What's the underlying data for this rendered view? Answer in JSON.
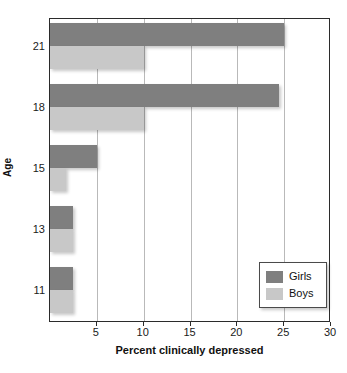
{
  "chart_data": {
    "type": "bar",
    "orientation": "horizontal",
    "title": "",
    "xlabel": "Percent clinically depressed",
    "ylabel": "Age",
    "categories": [
      "21",
      "18",
      "15",
      "13",
      "11"
    ],
    "series": [
      {
        "name": "Girls",
        "color": "#7f7f7f",
        "values": [
          25,
          24.5,
          5,
          2.5,
          2.5
        ]
      },
      {
        "name": "Boys",
        "color": "#c8c8c8",
        "values": [
          10,
          10,
          1.7,
          2.5,
          2.5
        ]
      }
    ],
    "xlim": [
      0,
      30
    ],
    "xticks": [
      "5",
      "10",
      "15",
      "20",
      "25",
      "30"
    ],
    "xtick_values": [
      5,
      10,
      15,
      20,
      25,
      30
    ],
    "grid": true,
    "grid_axis": "x",
    "legend_position": "bottom-right",
    "legend_entries": [
      "Girls",
      "Boys"
    ]
  },
  "axis": {
    "x_title": "Percent clinically depressed",
    "y_title": "Age"
  },
  "legend": {
    "items": [
      {
        "label": "Girls"
      },
      {
        "label": "Boys"
      }
    ]
  }
}
